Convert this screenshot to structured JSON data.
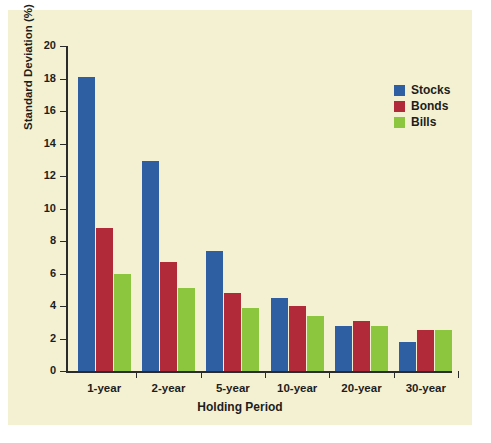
{
  "chart_data": {
    "type": "bar",
    "title": "",
    "xlabel": "Holding Period",
    "ylabel": "Standard Deviation (%)",
    "categories": [
      "1-year",
      "2-year",
      "5-year",
      "10-year",
      "20-year",
      "30-year"
    ],
    "series": [
      {
        "name": "Stocks",
        "color": "#2e5fa3",
        "values": [
          18.1,
          12.9,
          7.4,
          4.5,
          2.8,
          1.8
        ]
      },
      {
        "name": "Bonds",
        "color": "#b02a3a",
        "values": [
          8.8,
          6.7,
          4.8,
          4.0,
          3.1,
          2.5
        ]
      },
      {
        "name": "Bills",
        "color": "#8cc63e",
        "values": [
          6.0,
          5.1,
          3.9,
          3.4,
          2.8,
          2.5
        ]
      }
    ],
    "ylim": [
      0,
      20
    ],
    "yticks": [
      0,
      2,
      4,
      6,
      8,
      10,
      12,
      14,
      16,
      18,
      20
    ],
    "ytick_labels": [
      "0",
      "2",
      "4",
      "6",
      "8",
      "10",
      "12",
      "14",
      "16",
      "18",
      "20"
    ],
    "grid": false,
    "legend_position": "top-right",
    "background_color": "#f4f1d2",
    "axis_color": "#2b2b2b"
  }
}
